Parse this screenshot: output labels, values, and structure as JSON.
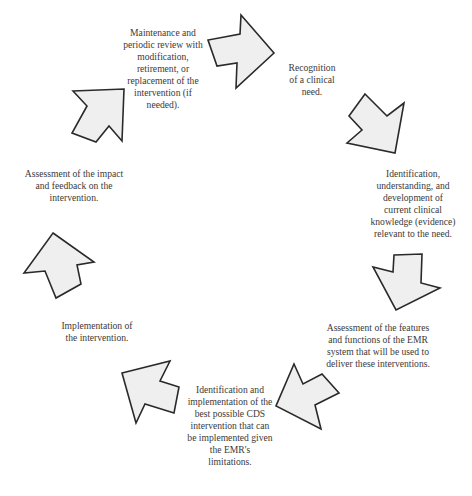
{
  "diagram": {
    "type": "cycle",
    "colors": {
      "arrow_fill": "#efefef",
      "arrow_stroke": "#2a2a2a",
      "text": "#3a3a3a",
      "background": "#ffffff"
    },
    "steps": [
      {
        "id": 1,
        "label": "Recognition\nof a clinical\nneed."
      },
      {
        "id": 2,
        "label": "Identification,\nunderstanding, and\ndevelopment of\ncurrent clinical\nknowledge (evidence)\nrelevant to the need."
      },
      {
        "id": 3,
        "label": "Assessment of the features\nand functions of the EMR\nsystem that will be used to\ndeliver these interventions."
      },
      {
        "id": 4,
        "label": "Identification and\nimplementation of the\nbest possible CDS\nintervention that can\nbe implemented given\nthe EMR's\nlimitations."
      },
      {
        "id": 5,
        "label": "Implementation of\nthe intervention."
      },
      {
        "id": 6,
        "label": "Assessment of the impact\nand feedback on the\nintervention."
      },
      {
        "id": 7,
        "label": "Maintenance and\nperiodic review with\nmodification,\nretirement, or\nreplacement of the\nintervention (if\nneeded)."
      }
    ],
    "arrows": [
      {
        "id": "arrow-1",
        "direction": "right",
        "points": "274,53 241,15 240,34 208,40 217,66 237,63 236,88"
      },
      {
        "id": "arrow-2",
        "direction": "down-right",
        "points": "365,94 387,116 404,103 395,153 347,143 362,130 349,116"
      },
      {
        "id": "arrow-3",
        "direction": "down",
        "points": "394,255 422,254 421,283 440,288 396,310 373,267 393,272"
      },
      {
        "id": "arrow-4",
        "direction": "down-left",
        "points": "294,364 303,384 322,374 339,393 315,405 321,429 276,406"
      },
      {
        "id": "arrow-5",
        "direction": "up-left",
        "points": "122,373 170,361 160,381 179,387 174,413 145,404 136,423"
      },
      {
        "id": "arrow-6",
        "direction": "up",
        "points": "53,233 94,262 77,265 81,284 56,298 45,271 24,273"
      },
      {
        "id": "arrow-7",
        "direction": "up-right",
        "points": "73,91 124,89 122,141 109,126 96,142 72,133 87,106"
      }
    ]
  }
}
